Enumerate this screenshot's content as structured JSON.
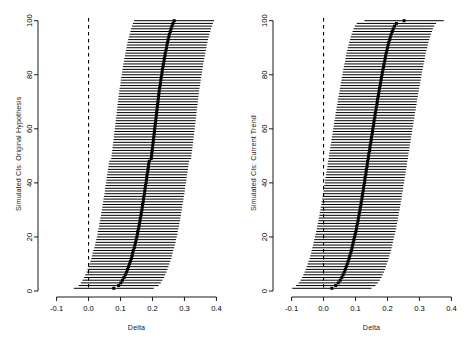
{
  "figure": {
    "background": "#ffffff",
    "ink": "#000000",
    "panel_count": 2
  },
  "panels": [
    {
      "id": "left",
      "ylabel": "Simulated CIs: Original Hypothesis",
      "xlabel": "Delta"
    },
    {
      "id": "right",
      "ylabel": "Simulated CIs: Current Trend",
      "xlabel": "Delta"
    }
  ],
  "chart_data": [
    {
      "type": "line",
      "id": "simulated-cis-original-hypothesis",
      "title": "",
      "subtitle": "",
      "xlabel": "Delta",
      "ylabel": "Simulated CIs: Original Hypothesis",
      "xlim": [
        -0.13,
        0.43
      ],
      "ylim": [
        0,
        101
      ],
      "xticks": [
        -0.1,
        0.0,
        0.1,
        0.2,
        0.3,
        0.4
      ],
      "xticklabels": [
        "-0.1",
        "0.0",
        "0.1",
        "0.2",
        "0.3",
        "0.4"
      ],
      "yticks": [
        0,
        20,
        40,
        60,
        80,
        100
      ],
      "yticklabels": [
        "0",
        "20",
        "40",
        "60",
        "80",
        "100"
      ],
      "grid": false,
      "legend": null,
      "reference_line": {
        "x": 0.0,
        "style": "dashed",
        "color": "#000000"
      },
      "marker": "point-estimate",
      "element": "horizontal confidence interval",
      "series": [
        {
          "name": "estimate",
          "values": [
            0.079,
            0.094,
            0.101,
            0.106,
            0.111,
            0.115,
            0.119,
            0.122,
            0.125,
            0.128,
            0.131,
            0.134,
            0.136,
            0.138,
            0.14,
            0.143,
            0.145,
            0.147,
            0.149,
            0.151,
            0.153,
            0.154,
            0.156,
            0.158,
            0.159,
            0.161,
            0.162,
            0.164,
            0.165,
            0.167,
            0.168,
            0.169,
            0.171,
            0.172,
            0.173,
            0.175,
            0.176,
            0.177,
            0.178,
            0.18,
            0.181,
            0.182,
            0.183,
            0.185,
            0.186,
            0.187,
            0.188,
            0.19,
            0.196,
            0.197,
            0.198,
            0.199,
            0.2,
            0.201,
            0.202,
            0.203,
            0.204,
            0.205,
            0.206,
            0.207,
            0.208,
            0.209,
            0.21,
            0.211,
            0.212,
            0.213,
            0.214,
            0.215,
            0.216,
            0.217,
            0.218,
            0.219,
            0.22,
            0.221,
            0.222,
            0.224,
            0.225,
            0.226,
            0.227,
            0.229,
            0.23,
            0.231,
            0.233,
            0.234,
            0.236,
            0.237,
            0.239,
            0.24,
            0.242,
            0.244,
            0.245,
            0.247,
            0.249,
            0.251,
            0.253,
            0.256,
            0.258,
            0.261,
            0.264,
            0.268
          ]
        },
        {
          "name": "lower",
          "values": [
            -0.046,
            -0.031,
            -0.024,
            -0.019,
            -0.014,
            -0.01,
            -0.006,
            -0.003,
            0.0,
            0.003,
            0.006,
            0.009,
            0.011,
            0.013,
            0.015,
            0.018,
            0.02,
            0.022,
            0.024,
            0.026,
            0.028,
            0.029,
            0.031,
            0.033,
            0.034,
            0.036,
            0.037,
            0.039,
            0.04,
            0.042,
            0.043,
            0.044,
            0.046,
            0.047,
            0.048,
            0.05,
            0.051,
            0.052,
            0.053,
            0.055,
            0.056,
            0.057,
            0.058,
            0.06,
            0.061,
            0.062,
            0.063,
            0.065,
            0.071,
            0.072,
            0.073,
            0.074,
            0.075,
            0.076,
            0.077,
            0.078,
            0.079,
            0.08,
            0.081,
            0.082,
            0.083,
            0.084,
            0.085,
            0.086,
            0.087,
            0.088,
            0.089,
            0.09,
            0.091,
            0.092,
            0.093,
            0.094,
            0.095,
            0.096,
            0.097,
            0.099,
            0.1,
            0.101,
            0.102,
            0.104,
            0.105,
            0.106,
            0.108,
            0.109,
            0.111,
            0.112,
            0.114,
            0.115,
            0.117,
            0.119,
            0.12,
            0.122,
            0.124,
            0.126,
            0.128,
            0.131,
            0.133,
            0.136,
            0.139,
            0.143
          ]
        },
        {
          "name": "upper",
          "values": [
            0.204,
            0.219,
            0.226,
            0.231,
            0.236,
            0.24,
            0.244,
            0.247,
            0.25,
            0.253,
            0.256,
            0.259,
            0.261,
            0.263,
            0.265,
            0.268,
            0.27,
            0.272,
            0.274,
            0.276,
            0.278,
            0.279,
            0.281,
            0.283,
            0.284,
            0.286,
            0.287,
            0.289,
            0.29,
            0.292,
            0.293,
            0.294,
            0.296,
            0.297,
            0.298,
            0.3,
            0.301,
            0.302,
            0.303,
            0.305,
            0.306,
            0.307,
            0.308,
            0.31,
            0.311,
            0.312,
            0.313,
            0.315,
            0.321,
            0.322,
            0.323,
            0.324,
            0.325,
            0.326,
            0.327,
            0.328,
            0.329,
            0.33,
            0.331,
            0.332,
            0.333,
            0.334,
            0.335,
            0.336,
            0.337,
            0.338,
            0.339,
            0.34,
            0.341,
            0.342,
            0.343,
            0.344,
            0.345,
            0.346,
            0.347,
            0.349,
            0.35,
            0.351,
            0.352,
            0.354,
            0.355,
            0.356,
            0.358,
            0.359,
            0.361,
            0.362,
            0.364,
            0.365,
            0.367,
            0.369,
            0.37,
            0.372,
            0.374,
            0.376,
            0.378,
            0.381,
            0.383,
            0.386,
            0.389,
            0.393
          ]
        }
      ]
    },
    {
      "type": "line",
      "id": "simulated-cis-current-trend",
      "title": "",
      "subtitle": "",
      "xlabel": "Delta",
      "ylabel": "Simulated CIs: Current Trend",
      "xlim": [
        -0.13,
        0.43
      ],
      "ylim": [
        0,
        101
      ],
      "xticks": [
        -0.1,
        0.0,
        0.1,
        0.2,
        0.3,
        0.4
      ],
      "xticklabels": [
        "-0.1",
        "0.0",
        "0.1",
        "0.2",
        "0.3",
        "0.4"
      ],
      "yticks": [
        0,
        20,
        40,
        60,
        80,
        100
      ],
      "yticklabels": [
        "0",
        "20",
        "40",
        "60",
        "80",
        "100"
      ],
      "grid": false,
      "legend": null,
      "reference_line": {
        "x": 0.0,
        "style": "dashed",
        "color": "#000000"
      },
      "marker": "point-estimate",
      "element": "horizontal confidence interval",
      "series": [
        {
          "name": "estimate",
          "values": [
            0.026,
            0.038,
            0.046,
            0.052,
            0.057,
            0.061,
            0.065,
            0.068,
            0.071,
            0.074,
            0.077,
            0.08,
            0.082,
            0.085,
            0.087,
            0.089,
            0.091,
            0.093,
            0.095,
            0.097,
            0.099,
            0.101,
            0.103,
            0.104,
            0.106,
            0.108,
            0.109,
            0.111,
            0.112,
            0.114,
            0.115,
            0.117,
            0.118,
            0.12,
            0.121,
            0.122,
            0.124,
            0.125,
            0.126,
            0.128,
            0.129,
            0.13,
            0.132,
            0.133,
            0.134,
            0.136,
            0.137,
            0.138,
            0.14,
            0.141,
            0.142,
            0.144,
            0.145,
            0.146,
            0.148,
            0.149,
            0.15,
            0.152,
            0.153,
            0.154,
            0.156,
            0.157,
            0.158,
            0.16,
            0.161,
            0.162,
            0.164,
            0.165,
            0.167,
            0.168,
            0.169,
            0.171,
            0.172,
            0.174,
            0.175,
            0.177,
            0.178,
            0.18,
            0.181,
            0.183,
            0.184,
            0.186,
            0.188,
            0.189,
            0.191,
            0.193,
            0.194,
            0.196,
            0.198,
            0.2,
            0.202,
            0.204,
            0.207,
            0.209,
            0.212,
            0.215,
            0.218,
            0.222,
            0.228,
            0.252
          ]
        },
        {
          "name": "lower",
          "values": [
            -0.098,
            -0.086,
            -0.078,
            -0.072,
            -0.067,
            -0.063,
            -0.059,
            -0.056,
            -0.053,
            -0.05,
            -0.047,
            -0.044,
            -0.042,
            -0.039,
            -0.037,
            -0.035,
            -0.033,
            -0.031,
            -0.029,
            -0.027,
            -0.025,
            -0.023,
            -0.021,
            -0.02,
            -0.018,
            -0.016,
            -0.015,
            -0.013,
            -0.012,
            -0.01,
            -0.009,
            -0.007,
            -0.006,
            -0.004,
            -0.003,
            -0.002,
            0.0,
            0.001,
            0.002,
            0.004,
            0.005,
            0.006,
            0.008,
            0.009,
            0.01,
            0.012,
            0.013,
            0.014,
            0.016,
            0.017,
            0.018,
            0.02,
            0.021,
            0.022,
            0.024,
            0.025,
            0.026,
            0.028,
            0.029,
            0.03,
            0.032,
            0.033,
            0.034,
            0.036,
            0.037,
            0.038,
            0.04,
            0.041,
            0.043,
            0.044,
            0.045,
            0.047,
            0.048,
            0.05,
            0.051,
            0.053,
            0.054,
            0.056,
            0.057,
            0.059,
            0.06,
            0.062,
            0.064,
            0.065,
            0.067,
            0.069,
            0.07,
            0.072,
            0.074,
            0.076,
            0.078,
            0.08,
            0.083,
            0.085,
            0.088,
            0.091,
            0.094,
            0.098,
            0.104,
            0.128
          ]
        },
        {
          "name": "upper",
          "values": [
            0.15,
            0.162,
            0.17,
            0.176,
            0.181,
            0.185,
            0.189,
            0.192,
            0.195,
            0.198,
            0.201,
            0.204,
            0.206,
            0.209,
            0.211,
            0.213,
            0.215,
            0.217,
            0.219,
            0.221,
            0.223,
            0.225,
            0.227,
            0.228,
            0.23,
            0.232,
            0.233,
            0.235,
            0.236,
            0.238,
            0.239,
            0.241,
            0.242,
            0.244,
            0.245,
            0.246,
            0.248,
            0.249,
            0.25,
            0.252,
            0.253,
            0.254,
            0.256,
            0.257,
            0.258,
            0.26,
            0.261,
            0.262,
            0.264,
            0.265,
            0.266,
            0.268,
            0.269,
            0.27,
            0.272,
            0.273,
            0.274,
            0.276,
            0.277,
            0.278,
            0.28,
            0.281,
            0.282,
            0.284,
            0.285,
            0.286,
            0.288,
            0.289,
            0.291,
            0.292,
            0.293,
            0.295,
            0.296,
            0.298,
            0.299,
            0.301,
            0.302,
            0.304,
            0.305,
            0.307,
            0.308,
            0.31,
            0.312,
            0.313,
            0.315,
            0.317,
            0.318,
            0.32,
            0.322,
            0.324,
            0.326,
            0.328,
            0.331,
            0.333,
            0.336,
            0.339,
            0.342,
            0.346,
            0.352,
            0.376
          ]
        }
      ]
    }
  ]
}
